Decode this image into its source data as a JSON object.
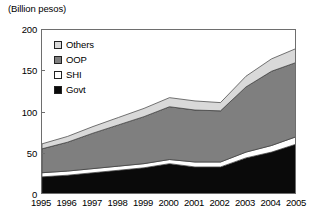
{
  "chart_data": {
    "type": "area",
    "stacked": true,
    "title": "(Billion pesos)",
    "xlabel": "",
    "ylabel": "(Billion pesos)",
    "categories": [
      "1995",
      "1996",
      "1997",
      "1998",
      "1999",
      "2000",
      "2001",
      "2002",
      "2003",
      "2004",
      "2005"
    ],
    "x": [
      1995,
      1996,
      1997,
      1998,
      1999,
      2000,
      2001,
      2002,
      2003,
      2004,
      2005
    ],
    "series": [
      {
        "name": "Govt",
        "color": "#0a0a0a",
        "values": [
          22,
          24,
          27,
          30,
          33,
          38,
          34,
          34,
          45,
          52,
          62
        ]
      },
      {
        "name": "SHI",
        "color": "#ffffff",
        "values": [
          5,
          5,
          5,
          5,
          5,
          5,
          6,
          6,
          7,
          8,
          9
        ]
      },
      {
        "name": "OOP",
        "color": "#7f7f7f",
        "values": [
          29,
          35,
          43,
          50,
          57,
          64,
          63,
          62,
          79,
          90,
          90
        ]
      },
      {
        "name": "Others",
        "color": "#d9d9d9",
        "values": [
          6,
          7,
          8,
          9,
          10,
          11,
          11,
          10,
          13,
          15,
          17
        ]
      }
    ],
    "totals": [
      62,
      71,
      83,
      94,
      105,
      118,
      114,
      112,
      144,
      165,
      178
    ],
    "ylim": [
      0,
      200
    ],
    "yticks": [
      0,
      50,
      100,
      150,
      200
    ],
    "xlim": [
      1995,
      2005
    ],
    "grid": false,
    "legend_position": "upper-left",
    "legend_order": [
      "Others",
      "OOP",
      "SHI",
      "Govt"
    ]
  },
  "legend": {
    "items": [
      {
        "label": "Others",
        "color": "#d9d9d9"
      },
      {
        "label": "OOP",
        "color": "#7f7f7f"
      },
      {
        "label": "SHI",
        "color": "#ffffff"
      },
      {
        "label": "Govt",
        "color": "#0a0a0a"
      }
    ]
  },
  "axis": {
    "y_title": "(Billion pesos)",
    "y_tick_labels": [
      "200",
      "150",
      "100",
      "50",
      "0"
    ],
    "x_tick_labels": [
      "1995",
      "1996",
      "1997",
      "1998",
      "1999",
      "2000",
      "2001",
      "2002",
      "2003",
      "2004",
      "2005"
    ]
  }
}
